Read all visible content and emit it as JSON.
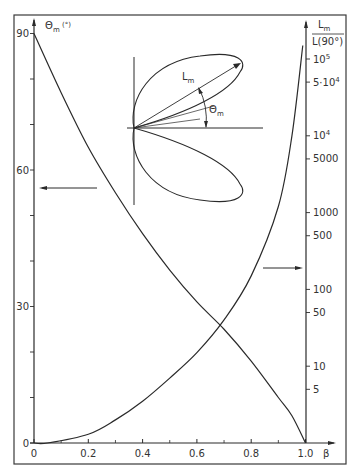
{
  "chart_data": {
    "type": "line",
    "title": "",
    "xlabel": "β",
    "ylabel_left": "Θm (°)",
    "ylabel_right": "Lm / L(90°)",
    "xlim": [
      0,
      1.0
    ],
    "ylim_left": [
      0,
      90
    ],
    "ylim_right": [
      1,
      100000
    ],
    "right_axis_scale": "log",
    "grid": false,
    "legend": "none (arrows indicate axis association)",
    "x_ticks": [
      "0",
      "0.2",
      "0.4",
      "0.6",
      "0.8",
      "1.0"
    ],
    "y_left_ticks": [
      "0",
      "30",
      "60",
      "90"
    ],
    "y_right_ticks": [
      "5",
      "10",
      "50",
      "100",
      "500",
      "1000",
      "5000",
      "10^4",
      "5·10^4",
      "10^5"
    ],
    "series": [
      {
        "name": "Θm",
        "axis": "left",
        "x": [
          0,
          0.1,
          0.2,
          0.3,
          0.4,
          0.5,
          0.6,
          0.7,
          0.8,
          0.9,
          0.95,
          1.0
        ],
        "values": [
          90,
          77,
          65,
          55,
          46,
          38,
          31,
          25,
          18,
          10,
          6,
          0
        ]
      },
      {
        "name": "Lm/L(90°)",
        "axis": "right",
        "x": [
          0.05,
          0.2,
          0.3,
          0.4,
          0.5,
          0.6,
          0.7,
          0.8,
          0.9,
          0.95,
          0.99
        ],
        "values": [
          1,
          1.3,
          2,
          3.5,
          7,
          15,
          40,
          150,
          1200,
          10000,
          150000
        ]
      }
    ],
    "annotations": [
      "Inset: two-lobed radiation pattern with max lobe length Lm at angle Θm from the horizontal axis",
      "Left-pointing arrow near Θm≈56 marks the Θm curve to the left axis",
      "Right-pointing arrow near Lm/L≈100 marks the Lm curve to the right axis"
    ]
  },
  "labels": {
    "left_axis": "Θ",
    "left_axis_sub": "m",
    "left_axis_unit": " (°)",
    "right_axis_num": "L",
    "right_axis_num_sub": "m",
    "right_axis_den": "L(90°)",
    "x_axis": "β",
    "inset_length": "L",
    "inset_length_sub": "m",
    "inset_angle": "Θ",
    "inset_angle_sub": "m"
  },
  "ticks": {
    "x": [
      {
        "label": "0",
        "v": 0
      },
      {
        "label": "0.2",
        "v": 0.2
      },
      {
        "label": "0.4",
        "v": 0.4
      },
      {
        "label": "0.6",
        "v": 0.6
      },
      {
        "label": "0.8",
        "v": 0.8
      },
      {
        "label": "1.0",
        "v": 1.0
      }
    ],
    "left": [
      {
        "label": "0",
        "v": 0
      },
      {
        "label": "30",
        "v": 30
      },
      {
        "label": "60",
        "v": 60
      },
      {
        "label": "90",
        "v": 90
      }
    ],
    "right": [
      {
        "label": "5",
        "v": 5
      },
      {
        "label": "10",
        "v": 10
      },
      {
        "label": "50",
        "v": 50
      },
      {
        "label": "100",
        "v": 100
      },
      {
        "label": "500",
        "v": 500
      },
      {
        "label": "1000",
        "v": 1000
      },
      {
        "label": "5000",
        "v": 5000
      },
      {
        "label": "10",
        "sup": "4",
        "v": 10000
      },
      {
        "label": "5·10",
        "sup": "4",
        "v": 50000
      },
      {
        "label": "10",
        "sup": "5",
        "v": 100000
      }
    ]
  },
  "colors": {
    "line": "#2a2a2a",
    "background": "#ffffff",
    "frame": "#3a3a3a"
  }
}
